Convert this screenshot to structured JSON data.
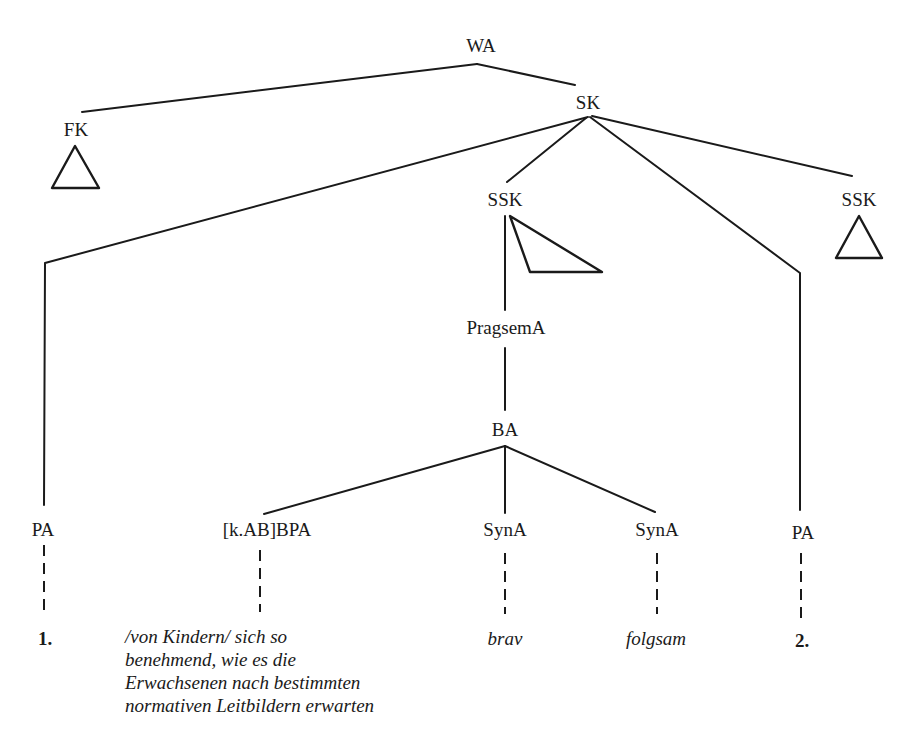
{
  "diagram": {
    "type": "syntax-tree",
    "root": "WA",
    "nodes": {
      "wa": "WA",
      "fk": "FK",
      "sk": "SK",
      "ssk_middle": "SSK",
      "ssk_right": "SSK",
      "pragsema": "PragsemA",
      "ba": "BA",
      "pa_left": "PA",
      "kab_bpa": "[k.AB]BPA",
      "syna_1": "SynA",
      "syna_2": "SynA",
      "pa_right": "PA"
    },
    "leaves": {
      "pa_left": "1.",
      "kab_bpa_lines": [
        "/von Kindern/ sich so",
        "benehmend, wie es die",
        "Erwachsenen nach bestimmten",
        "normativen Leitbildern erwarten"
      ],
      "syna_1": "brav",
      "syna_2": "folgsam",
      "pa_right": "2."
    },
    "edges": [
      [
        "WA",
        "FK"
      ],
      [
        "WA",
        "SK"
      ],
      [
        "SK",
        "PA (1)"
      ],
      [
        "SK",
        "SSK (middle)"
      ],
      [
        "SK",
        "PA (2)"
      ],
      [
        "SK",
        "SSK (right)"
      ],
      [
        "SSK (middle)",
        "PragsemA"
      ],
      [
        "PragsemA",
        "BA"
      ],
      [
        "BA",
        "[k.AB]BPA"
      ],
      [
        "BA",
        "SynA (brav)"
      ],
      [
        "BA",
        "SynA (folgsam)"
      ]
    ],
    "collapsed_subtrees": [
      "FK",
      "SSK (middle)",
      "SSK (right)"
    ],
    "colors": {
      "ink": "#1a1a1a",
      "background": "#ffffff"
    }
  }
}
